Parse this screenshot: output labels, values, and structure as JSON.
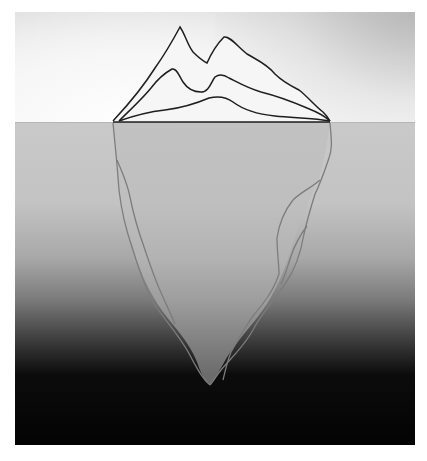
{
  "figure": {
    "colors": {
      "above_outline": "#1e1e1e",
      "below_outline": "#7d7d7d",
      "water_top": "#c9c9c9",
      "water_bottom": "#030303",
      "sky_top": "#d6d6d6",
      "sky_bottom": "#f8f8f8",
      "submerged_fill": "#b9b9b9"
    }
  },
  "caption": {
    "text": "",
    "visible": "clipped"
  }
}
